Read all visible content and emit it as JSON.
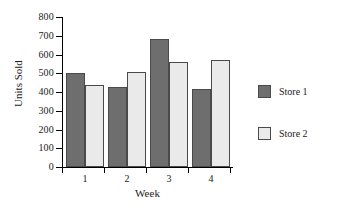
{
  "chart_data": {
    "type": "bar",
    "title": "",
    "subtitle": "",
    "xlabel": "Week",
    "ylabel": "Units Sold",
    "categories": [
      "1",
      "2",
      "3",
      "4"
    ],
    "series": [
      {
        "name": "Store 1",
        "values": [
          500,
          425,
          682,
          418
        ],
        "color": "#6e6e6e"
      },
      {
        "name": "Store 2",
        "values": [
          440,
          505,
          562,
          572
        ],
        "color": "#eaeaea"
      }
    ],
    "ylim": [
      0,
      800
    ],
    "ytick_step": 100,
    "yticks": [
      "800",
      "700",
      "600",
      "500",
      "400",
      "300",
      "200",
      "100",
      "0"
    ],
    "grid": false,
    "legend_position": "right",
    "annotations": []
  },
  "legend": {
    "entries": [
      {
        "label": "Store 1"
      },
      {
        "label": "Store 2"
      }
    ]
  },
  "axes": {
    "y_title": "Units Sold",
    "x_title": "Week"
  },
  "colors": {
    "store1_fill": "#6e6e6e",
    "store2_fill": "#eaeaea",
    "bar_border": "#4a4a4a",
    "axis": "#000000",
    "background": "#ffffff",
    "text": "#1a1a1a"
  }
}
